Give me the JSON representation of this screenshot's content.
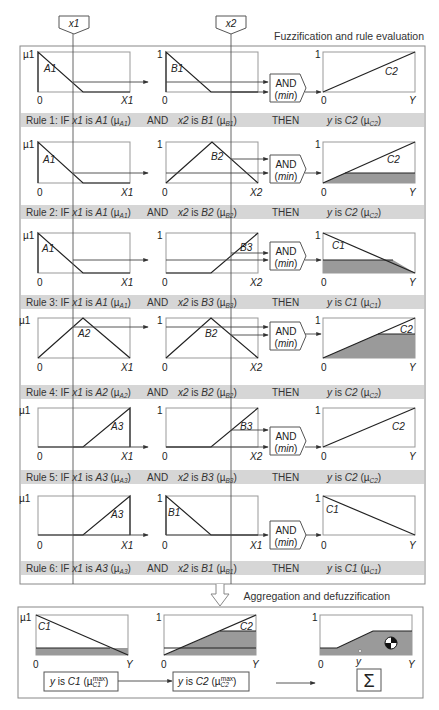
{
  "sections": {
    "fuzzification_title": "Fuzzification and rule evaluation",
    "aggregation_title": "Aggregation and defuzzification"
  },
  "inputs": [
    {
      "label": "x1"
    },
    {
      "label": "x2"
    }
  ],
  "and_box": {
    "line1": "AND",
    "line2": "min"
  },
  "axis": {
    "mu1": "µ1",
    "one": "1",
    "zero": "0",
    "X1": "X1",
    "X2": "X2",
    "Y": "Y",
    "y": "y"
  },
  "rules": [
    {
      "n": "Rule 1:",
      "if": "IF",
      "x1": "x1",
      "is1": "is",
      "A": "A1",
      "muA": "(µ",
      "subA": "A1",
      "close1": ")",
      "and": "AND",
      "x2": "x2",
      "is2": "is",
      "B": "B1",
      "muB": "(µ",
      "subB": "B1",
      "close2": ")",
      "then": "THEN",
      "y": "y",
      "is3": "is",
      "C": "C2",
      "muC": "(µ",
      "subC": "C2",
      "close3": ")",
      "charts": {
        "left": "A1",
        "mid": "B1",
        "right": "C2",
        "mid_xlabel": ""
      }
    },
    {
      "n": "Rule 2:",
      "if": "IF",
      "x1": "x1",
      "is1": "is",
      "A": "A1",
      "muA": "(µ",
      "subA": "A1",
      "close1": ")",
      "and": "AND",
      "x2": "x2",
      "is2": "is",
      "B": "B2",
      "muB": "(µ",
      "subB": "B2",
      "close2": ")",
      "then": "THEN",
      "y": "y",
      "is3": "is",
      "C": "C2",
      "muC": "(µ",
      "subC": "C2",
      "close3": ")",
      "charts": {
        "left": "A1",
        "mid": "B2",
        "right": "C2",
        "mid_xlabel": "X2"
      }
    },
    {
      "n": "Rule 3:",
      "if": "IF",
      "x1": "x1",
      "is1": "is",
      "A": "A1",
      "muA": "(µ",
      "subA": "A1",
      "close1": ")",
      "and": "AND",
      "x2": "x2",
      "is2": "is",
      "B": "B3",
      "muB": "(µ",
      "subB": "B3",
      "close2": ")",
      "then": "THEN",
      "y": "y",
      "is3": "is",
      "C": "C1",
      "muC": "(µ",
      "subC": "C1",
      "close3": ")",
      "charts": {
        "left": "A1",
        "mid": "B3",
        "right": "C1",
        "mid_xlabel": "X2"
      }
    },
    {
      "n": "Rule 4:",
      "if": "IF",
      "x1": "x1",
      "is1": "is",
      "A": "A2",
      "muA": "(µ",
      "subA": "A2",
      "close1": ")",
      "and": "AND",
      "x2": "x2",
      "is2": "is",
      "B": "B2",
      "muB": "(µ",
      "subB": "B2",
      "close2": ")",
      "then": "THEN",
      "y": "y",
      "is3": "is",
      "C": "C2",
      "muC": "(µ",
      "subC": "C2",
      "close3": ")",
      "charts": {
        "left": "A2",
        "mid": "B2",
        "right": "C2",
        "mid_xlabel": "X2"
      }
    },
    {
      "n": "Rule 5:",
      "if": "IF",
      "x1": "x1",
      "is1": "is",
      "A": "A3",
      "muA": "(µ",
      "subA": "A3",
      "close1": ")",
      "and": "AND",
      "x2": "x2",
      "is2": "is",
      "B": "B3",
      "muB": "(µ",
      "subB": "B3",
      "close2": ")",
      "then": "THEN",
      "y": "y",
      "is3": "is",
      "C": "C2",
      "muC": "(µ",
      "subC": "C2",
      "close3": ")",
      "charts": {
        "left": "A3",
        "mid": "B3",
        "right": "C2",
        "mid_xlabel": "X2"
      }
    },
    {
      "n": "Rule 6:",
      "if": "IF",
      "x1": "x1",
      "is1": "is",
      "A": "A3",
      "muA": "(µ",
      "subA": "A3",
      "close1": ")",
      "and": "AND",
      "x2": "x2",
      "is2": "is",
      "B": "B1",
      "muB": "(µ",
      "subB": "B1",
      "close2": ")",
      "then": "THEN",
      "y": "y",
      "is3": "is",
      "C": "C1",
      "muC": "(µ",
      "subC": "C1",
      "close3": ")",
      "charts": {
        "left": "A3",
        "mid": "B1",
        "right": "C1",
        "mid_xlabel": "X1"
      }
    }
  ],
  "aggregation": {
    "left_label": "C1",
    "mid_label": "C2",
    "box1": {
      "y": "y",
      "is": "is",
      "C": "C1",
      "mu": "(µ",
      "sub": "C1",
      "sup": "max",
      "close": ")"
    },
    "box2": {
      "y": "y",
      "is": "is",
      "C": "C2",
      "mu": "(µ",
      "sub": "C2",
      "sup": "max",
      "close": ")"
    },
    "sum_symbol": "Σ"
  },
  "colors": {
    "rule_bar": "#d6d6d6",
    "fill": "#9a9a9a",
    "line": "#222222",
    "frame": "#888888"
  }
}
